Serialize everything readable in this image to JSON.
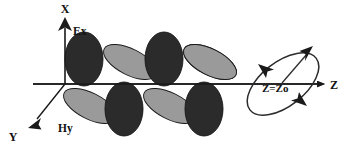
{
  "figure": {
    "background_color": "#ffffff",
    "width": 349,
    "height": 147
  },
  "axes": {
    "x_axis": {
      "label": "X",
      "direction": "up",
      "label_x": 61,
      "label_y": 13,
      "line": {
        "x1": 65,
        "y1": 20,
        "x2": 65,
        "y2": 84
      },
      "arrow": "triangle-up"
    },
    "y_axis": {
      "label": "Y",
      "direction": "down-left",
      "label_x": 12,
      "label_y": 140,
      "line": {
        "x1": 65,
        "y1": 84,
        "x2": 32,
        "y2": 125
      },
      "arrow": "triangle-down-left"
    },
    "z_axis": {
      "label": "Z",
      "direction": "right",
      "label_x": 334,
      "label_y": 89,
      "line": {
        "x1": 33,
        "y1": 84,
        "x2": 320,
        "y2": 84
      },
      "arrow": "triangle-right"
    },
    "origin": {
      "x": 65,
      "y": 84
    }
  },
  "fields": {
    "electric": {
      "label": "Ex",
      "label_x": 73,
      "label_y": 35,
      "color": "#2b2b2b",
      "orientation": "vertical",
      "description": "Electric field component along X"
    },
    "magnetic": {
      "label": "Hy",
      "label_x": 59,
      "label_y": 131,
      "color": "#9a9a9a",
      "orientation": "tilted-toward-y",
      "description": "Magnetic field component along Y"
    }
  },
  "wave": {
    "ex_lobes": [
      {
        "cx": 84,
        "cy": 60,
        "rx": 19,
        "ry": 26,
        "sign": "positive"
      },
      {
        "cx": 124,
        "cy": 108,
        "rx": 19,
        "ry": 26,
        "sign": "negative"
      },
      {
        "cx": 164,
        "cy": 60,
        "rx": 19,
        "ry": 26,
        "sign": "positive"
      },
      {
        "cx": 204,
        "cy": 108,
        "rx": 19,
        "ry": 26,
        "sign": "negative"
      }
    ],
    "hy_lobes": [
      {
        "cx": 90,
        "cy": 106,
        "rx": 29,
        "ry": 13,
        "rotate": 27,
        "sign": "negative"
      },
      {
        "cx": 130,
        "cy": 62,
        "rx": 29,
        "ry": 13,
        "rotate": 27,
        "sign": "positive"
      },
      {
        "cx": 170,
        "cy": 106,
        "rx": 29,
        "ry": 13,
        "rotate": 27,
        "sign": "negative"
      },
      {
        "cx": 210,
        "cy": 62,
        "rx": 29,
        "ry": 13,
        "rotate": 27,
        "sign": "positive"
      }
    ],
    "ex_color": "#2b2b2b",
    "hy_color": "#9a9a9a",
    "outline_color": "#1a1a1a"
  },
  "polarization_ellipse": {
    "label": "Z=Zo",
    "label_x": 263,
    "label_y": 91,
    "center": {
      "cx": 283,
      "cy": 84
    },
    "rx": 42,
    "ry": 22,
    "rotate": -38,
    "stroke": "#2b2b2b",
    "rotation_arrows": [
      "upper-left",
      "lower-right"
    ],
    "vector_arrow": {
      "from": {
        "x": 283,
        "y": 84
      },
      "to": {
        "x": 312,
        "y": 50
      },
      "label": "field vector"
    }
  }
}
